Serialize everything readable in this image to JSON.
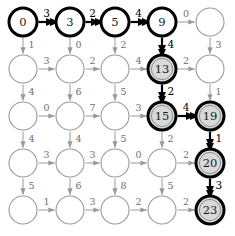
{
  "figure": {
    "kind": "dag-shortest-path-grid",
    "grid": {
      "rows": 5,
      "cols": 5
    },
    "geometry": {
      "col_x": [
        23,
        70,
        115,
        162,
        210
      ],
      "row_y": [
        22,
        69,
        116,
        163,
        210
      ],
      "node_radius": 14
    },
    "colors": {
      "dim": "#9a9a9a",
      "bold": "#000000",
      "node_fill_plain": "#ffffff",
      "node_fill_highlight": "#d9d9d9",
      "node_inner_ring": "#8f8f8f",
      "text_dim": "#6f6f6f",
      "text_bold": "#000000"
    }
  },
  "nodes": [
    {
      "id": "n00",
      "row": 0,
      "col": 0,
      "label": "0",
      "style": "bold-start"
    },
    {
      "id": "n01",
      "row": 0,
      "col": 1,
      "label": "3",
      "style": "bold-start"
    },
    {
      "id": "n02",
      "row": 0,
      "col": 2,
      "label": "5",
      "style": "bold-start"
    },
    {
      "id": "n03",
      "row": 0,
      "col": 3,
      "label": "9",
      "style": "bold-start"
    },
    {
      "id": "n04",
      "row": 0,
      "col": 4,
      "label": "",
      "style": "plain"
    },
    {
      "id": "n10",
      "row": 1,
      "col": 0,
      "label": "",
      "style": "plain"
    },
    {
      "id": "n11",
      "row": 1,
      "col": 1,
      "label": "",
      "style": "plain"
    },
    {
      "id": "n12",
      "row": 1,
      "col": 2,
      "label": "",
      "style": "plain"
    },
    {
      "id": "n13",
      "row": 1,
      "col": 3,
      "label": "13",
      "style": "highlight"
    },
    {
      "id": "n14",
      "row": 1,
      "col": 4,
      "label": "",
      "style": "plain"
    },
    {
      "id": "n20",
      "row": 2,
      "col": 0,
      "label": "",
      "style": "plain"
    },
    {
      "id": "n21",
      "row": 2,
      "col": 1,
      "label": "",
      "style": "plain"
    },
    {
      "id": "n22",
      "row": 2,
      "col": 2,
      "label": "",
      "style": "plain"
    },
    {
      "id": "n23",
      "row": 2,
      "col": 3,
      "label": "15",
      "style": "highlight"
    },
    {
      "id": "n24",
      "row": 2,
      "col": 4,
      "label": "19",
      "style": "highlight"
    },
    {
      "id": "n30",
      "row": 3,
      "col": 0,
      "label": "",
      "style": "plain"
    },
    {
      "id": "n31",
      "row": 3,
      "col": 1,
      "label": "",
      "style": "plain"
    },
    {
      "id": "n32",
      "row": 3,
      "col": 2,
      "label": "",
      "style": "plain"
    },
    {
      "id": "n33",
      "row": 3,
      "col": 3,
      "label": "",
      "style": "plain"
    },
    {
      "id": "n34",
      "row": 3,
      "col": 4,
      "label": "20",
      "style": "highlight"
    },
    {
      "id": "n40",
      "row": 4,
      "col": 0,
      "label": "",
      "style": "plain"
    },
    {
      "id": "n41",
      "row": 4,
      "col": 1,
      "label": "",
      "style": "plain"
    },
    {
      "id": "n42",
      "row": 4,
      "col": 2,
      "label": "",
      "style": "plain"
    },
    {
      "id": "n43",
      "row": 4,
      "col": 3,
      "label": "",
      "style": "plain"
    },
    {
      "id": "n44",
      "row": 4,
      "col": 4,
      "label": "23",
      "style": "highlight"
    }
  ],
  "edges_horizontal": [
    {
      "row": 0,
      "col": 0,
      "weight": "3",
      "bold": true
    },
    {
      "row": 0,
      "col": 1,
      "weight": "2",
      "bold": true
    },
    {
      "row": 0,
      "col": 2,
      "weight": "4",
      "bold": true
    },
    {
      "row": 0,
      "col": 3,
      "weight": "0",
      "bold": false
    },
    {
      "row": 1,
      "col": 0,
      "weight": "3",
      "bold": false
    },
    {
      "row": 1,
      "col": 1,
      "weight": "2",
      "bold": false
    },
    {
      "row": 1,
      "col": 2,
      "weight": "4",
      "bold": false
    },
    {
      "row": 1,
      "col": 3,
      "weight": "2",
      "bold": false
    },
    {
      "row": 2,
      "col": 0,
      "weight": "0",
      "bold": false
    },
    {
      "row": 2,
      "col": 1,
      "weight": "7",
      "bold": false
    },
    {
      "row": 2,
      "col": 2,
      "weight": "3",
      "bold": false
    },
    {
      "row": 2,
      "col": 3,
      "weight": "4",
      "bold": true
    },
    {
      "row": 3,
      "col": 0,
      "weight": "3",
      "bold": false
    },
    {
      "row": 3,
      "col": 1,
      "weight": "3",
      "bold": false
    },
    {
      "row": 3,
      "col": 2,
      "weight": "0",
      "bold": false
    },
    {
      "row": 3,
      "col": 3,
      "weight": "2",
      "bold": false
    },
    {
      "row": 4,
      "col": 0,
      "weight": "1",
      "bold": false
    },
    {
      "row": 4,
      "col": 1,
      "weight": "3",
      "bold": false
    },
    {
      "row": 4,
      "col": 2,
      "weight": "2",
      "bold": false
    },
    {
      "row": 4,
      "col": 3,
      "weight": "2",
      "bold": false
    }
  ],
  "edges_vertical": [
    {
      "col": 0,
      "row": 0,
      "weight": "1",
      "bold": false
    },
    {
      "col": 1,
      "row": 0,
      "weight": "0",
      "bold": false
    },
    {
      "col": 2,
      "row": 0,
      "weight": "2",
      "bold": false
    },
    {
      "col": 3,
      "row": 0,
      "weight": "4",
      "bold": true
    },
    {
      "col": 4,
      "row": 0,
      "weight": "3",
      "bold": false
    },
    {
      "col": 0,
      "row": 1,
      "weight": "4",
      "bold": false
    },
    {
      "col": 1,
      "row": 1,
      "weight": "6",
      "bold": false
    },
    {
      "col": 2,
      "row": 1,
      "weight": "5",
      "bold": false
    },
    {
      "col": 3,
      "row": 1,
      "weight": "2",
      "bold": true
    },
    {
      "col": 4,
      "row": 1,
      "weight": "1",
      "bold": false
    },
    {
      "col": 0,
      "row": 2,
      "weight": "4",
      "bold": false
    },
    {
      "col": 1,
      "row": 2,
      "weight": "4",
      "bold": false
    },
    {
      "col": 2,
      "row": 2,
      "weight": "5",
      "bold": false
    },
    {
      "col": 3,
      "row": 2,
      "weight": "2",
      "bold": false
    },
    {
      "col": 4,
      "row": 2,
      "weight": "1",
      "bold": true
    },
    {
      "col": 0,
      "row": 3,
      "weight": "5",
      "bold": false
    },
    {
      "col": 1,
      "row": 3,
      "weight": "6",
      "bold": false
    },
    {
      "col": 2,
      "row": 3,
      "weight": "8",
      "bold": false
    },
    {
      "col": 3,
      "row": 3,
      "weight": "5",
      "bold": false
    },
    {
      "col": 4,
      "row": 3,
      "weight": "3",
      "bold": true
    }
  ],
  "chart_data": {
    "type": "diagram",
    "title": "",
    "description_labels": [
      "0",
      "3",
      "5",
      "9",
      "13",
      "15",
      "19",
      "20",
      "23"
    ],
    "path_labels": [
      "0",
      "3",
      "5",
      "9",
      "13",
      "15",
      "19",
      "20",
      "23"
    ],
    "path_weights": [
      "3",
      "2",
      "4",
      "4",
      "2",
      "4",
      "1",
      "3"
    ]
  }
}
